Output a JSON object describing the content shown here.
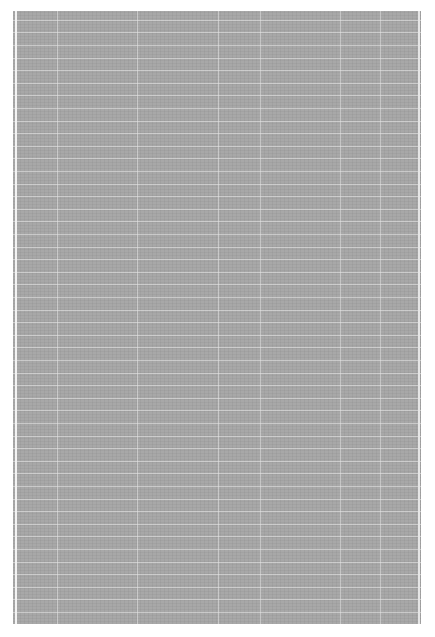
{
  "image": {
    "description": "Gray textured grid pattern",
    "background_color": "#ffffff",
    "sheet_color": "#a8a8a8",
    "grid_line_color": "#ebebeb",
    "horizontal_line_spacing_px": 12.6,
    "vertical_lines_x": [
      44,
      124,
      205,
      247,
      327,
      367
    ]
  }
}
